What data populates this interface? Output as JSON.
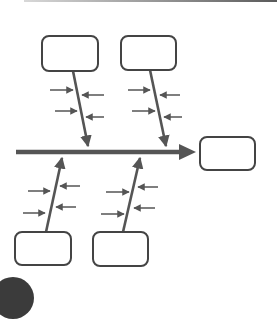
{
  "diagram": {
    "type": "fishbone",
    "colors": {
      "line": "#555555",
      "box_stroke": "#444444",
      "background": "#ffffff",
      "corner_blob": "#3b3b3b"
    },
    "spine": {
      "x1": 16,
      "y1": 152,
      "x2": 196,
      "y2": 152
    },
    "head_box": {
      "label": "",
      "x": 200,
      "y": 137,
      "w": 55,
      "h": 33
    },
    "categories": [
      {
        "label": "",
        "position": "top-left",
        "box": {
          "x": 42,
          "y": 36,
          "w": 56,
          "h": 35
        },
        "bone": {
          "x1": 73,
          "y1": 71,
          "x2": 88,
          "y2": 146
        },
        "causes": [
          {
            "x1": 50,
            "y1": 90,
            "x2": 73,
            "y2": 90
          },
          {
            "x1": 104,
            "y1": 95,
            "x2": 82,
            "y2": 95
          },
          {
            "x1": 55,
            "y1": 111,
            "x2": 77,
            "y2": 111
          },
          {
            "x1": 104,
            "y1": 117,
            "x2": 86,
            "y2": 117
          }
        ]
      },
      {
        "label": "",
        "position": "top-right",
        "box": {
          "x": 121,
          "y": 36,
          "w": 55,
          "h": 34
        },
        "bone": {
          "x1": 150,
          "y1": 70,
          "x2": 166,
          "y2": 146
        },
        "causes": [
          {
            "x1": 128,
            "y1": 90,
            "x2": 150,
            "y2": 90
          },
          {
            "x1": 180,
            "y1": 95,
            "x2": 160,
            "y2": 95
          },
          {
            "x1": 132,
            "y1": 111,
            "x2": 155,
            "y2": 111
          },
          {
            "x1": 182,
            "y1": 117,
            "x2": 164,
            "y2": 117
          }
        ]
      },
      {
        "label": "",
        "position": "bottom-left",
        "box": {
          "x": 15,
          "y": 232,
          "w": 56,
          "h": 33
        },
        "bone": {
          "x1": 46,
          "y1": 232,
          "x2": 62,
          "y2": 158
        },
        "causes": [
          {
            "x1": 28,
            "y1": 191,
            "x2": 50,
            "y2": 191
          },
          {
            "x1": 80,
            "y1": 186,
            "x2": 60,
            "y2": 186
          },
          {
            "x1": 23,
            "y1": 213,
            "x2": 45,
            "y2": 213
          },
          {
            "x1": 76,
            "y1": 207,
            "x2": 56,
            "y2": 207
          }
        ]
      },
      {
        "label": "",
        "position": "bottom-right",
        "box": {
          "x": 93,
          "y": 232,
          "w": 55,
          "h": 34
        },
        "bone": {
          "x1": 123,
          "y1": 232,
          "x2": 140,
          "y2": 158
        },
        "causes": [
          {
            "x1": 106,
            "y1": 192,
            "x2": 129,
            "y2": 192
          },
          {
            "x1": 158,
            "y1": 187,
            "x2": 138,
            "y2": 187
          },
          {
            "x1": 101,
            "y1": 214,
            "x2": 124,
            "y2": 214
          },
          {
            "x1": 155,
            "y1": 208,
            "x2": 134,
            "y2": 208
          }
        ]
      }
    ]
  }
}
